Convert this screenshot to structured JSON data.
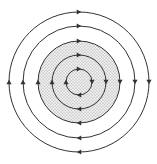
{
  "diagram": {
    "center": [
      79,
      82
    ],
    "direction": "clockwise",
    "line_color": "#333333",
    "shade_color": "#d6d6d6",
    "shaded_radius": 41,
    "circles": [
      {
        "r": 70
      },
      {
        "r": 56
      },
      {
        "r": 41
      },
      {
        "r": 27
      },
      {
        "r": 13
      }
    ]
  }
}
